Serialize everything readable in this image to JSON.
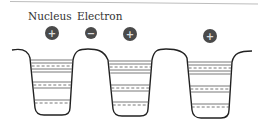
{
  "diagram": {
    "labels": {
      "nucleus": "Nucleus",
      "electron": "Electron"
    },
    "particles": [
      {
        "type": "nucleus",
        "sign": "+",
        "cx": 52,
        "cy": 33,
        "r": 7
      },
      {
        "type": "electron",
        "sign": "−",
        "cx": 91,
        "cy": 33,
        "r": 6
      },
      {
        "type": "nucleus",
        "sign": "+",
        "cx": 130,
        "cy": 34,
        "r": 7
      },
      {
        "type": "nucleus",
        "sign": "+",
        "cx": 210,
        "cy": 36,
        "r": 7
      }
    ],
    "wells": [
      {
        "name": "well-1",
        "left": 30,
        "right": 73,
        "bottom": 115
      },
      {
        "name": "well-2",
        "left": 108,
        "right": 152,
        "bottom": 116
      },
      {
        "name": "well-3",
        "left": 190,
        "right": 232,
        "bottom": 118
      }
    ],
    "colors": {
      "particle_fill": "#4a4a4a",
      "particle_sign": "#dddddd",
      "line": "#222222",
      "level_line": "#555555",
      "top_rule": "#bbbbbb"
    }
  }
}
